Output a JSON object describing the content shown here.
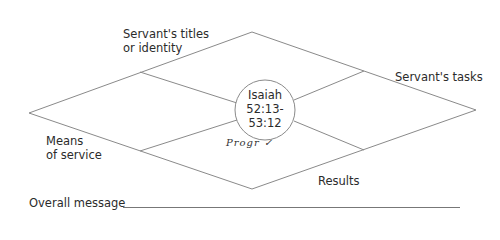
{
  "diagram": {
    "labels": {
      "top_left": [
        "Servant's titles",
        "or identity"
      ],
      "top_right": "Servant's tasks",
      "bottom_left": [
        "Means",
        "of service"
      ],
      "bottom_right": "Results"
    },
    "center": {
      "lines": [
        "Isaiah",
        "52:13-",
        "53:12"
      ]
    },
    "handwritten_note": "Progr ✓",
    "overall_message_label": "Overall message",
    "colors": {
      "line": "#8a8a8a",
      "text": "#2b2b2b",
      "background": "#ffffff"
    }
  }
}
